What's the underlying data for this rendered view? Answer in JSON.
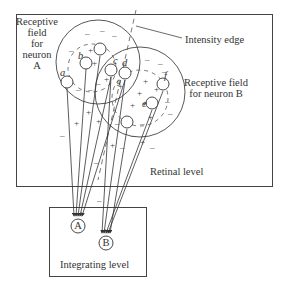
{
  "figure": {
    "retinal_level_label": "Retinal level",
    "integrating_level_label": "Integrating level",
    "intensity_edge_label": "Intensity edge",
    "receptive_field_A": [
      "Receptive",
      "field",
      "for",
      "neuron",
      "A"
    ],
    "receptive_field_B": [
      "Receptive field",
      "for neuron B"
    ],
    "neurons": [
      {
        "id": "A",
        "label": "A"
      },
      {
        "id": "B",
        "label": "B"
      }
    ],
    "receptors": [
      {
        "label": "a"
      },
      {
        "label": "b"
      },
      {
        "label": "c"
      },
      {
        "label": "d"
      },
      {
        "label": "e"
      },
      {
        "label": "f"
      },
      {
        "label": "g"
      }
    ],
    "signs": {
      "excitatory": "+",
      "inhibitory": "–"
    },
    "colors": {
      "line": "#333333",
      "background": "#ffffff"
    }
  }
}
